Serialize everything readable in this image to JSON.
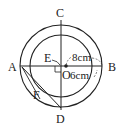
{
  "diagram": {
    "type": "concentric-circles-geometry",
    "points": {
      "A": "A",
      "B": "B",
      "C": "C",
      "D": "D",
      "E": "E",
      "F": "F",
      "O": "O"
    },
    "measurements": {
      "outer_radius": "8cm",
      "inner_radius": "6cm"
    },
    "colors": {
      "stroke": "#222222",
      "background": "#ffffff"
    }
  }
}
